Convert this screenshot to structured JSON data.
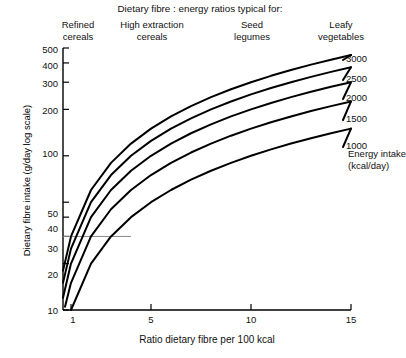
{
  "chart_data": {
    "type": "line",
    "title": "Dietary fibre : energy ratios typical for:",
    "xlabel": "Ratio dietary fibre per 100 kcal",
    "ylabel": "Dietary fibre intake (g/day log scale)",
    "yscale": "log",
    "xlim": [
      0.6,
      15
    ],
    "ylim": [
      10,
      500
    ],
    "xticks": [
      1,
      5,
      10,
      15
    ],
    "xtick_labels": [
      "1",
      "5",
      "10",
      "15"
    ],
    "yticks": [
      10,
      20,
      30,
      40,
      50,
      100,
      200,
      300,
      400,
      500
    ],
    "ytick_labels": [
      "10",
      "20",
      "30",
      "40",
      "50",
      "100",
      "200",
      "300",
      "400",
      "500"
    ],
    "grid": false,
    "legend_position": "right-inline",
    "annotations": [
      {
        "name": "reference-line-30",
        "type": "hline",
        "y": 30,
        "x_start": 0.6,
        "x_end": 4.0
      }
    ],
    "category_headers": [
      {
        "label": "Refined\ncereals",
        "x": 1.0
      },
      {
        "label": "High extraction\ncereals",
        "x": 3.8
      },
      {
        "label": "Seed\nlegumes",
        "x": 9.0
      },
      {
        "label": "Leafy\nvegetables",
        "x": 13.5
      }
    ],
    "series_caption": "Energy intake\n(kcal/day)",
    "series": [
      {
        "name": "3000",
        "label": "3000",
        "kcal_per_day": 3000,
        "x": [
          0.6,
          1,
          2,
          3,
          4,
          5,
          6,
          7,
          8,
          9,
          10,
          11,
          12,
          13,
          14,
          15
        ],
        "values": [
          18,
          30,
          60,
          90,
          120,
          150,
          180,
          210,
          240,
          270,
          300,
          330,
          360,
          390,
          420,
          450
        ]
      },
      {
        "name": "2500",
        "label": "2500",
        "kcal_per_day": 2500,
        "x": [
          0.6,
          1,
          2,
          3,
          4,
          5,
          6,
          7,
          8,
          9,
          10,
          11,
          12,
          13,
          14,
          15
        ],
        "values": [
          15,
          25,
          50,
          75,
          100,
          125,
          150,
          175,
          200,
          225,
          250,
          275,
          300,
          325,
          350,
          375
        ]
      },
      {
        "name": "2000",
        "label": "2000",
        "kcal_per_day": 2000,
        "x": [
          0.6,
          1,
          2,
          3,
          4,
          5,
          6,
          7,
          8,
          9,
          10,
          11,
          12,
          13,
          14,
          15
        ],
        "values": [
          12,
          20,
          40,
          60,
          80,
          100,
          120,
          140,
          160,
          180,
          200,
          220,
          240,
          260,
          280,
          300
        ]
      },
      {
        "name": "1500",
        "label": "1500",
        "kcal_per_day": 1500,
        "x": [
          0.7,
          1,
          2,
          3,
          4,
          5,
          6,
          7,
          8,
          9,
          10,
          11,
          12,
          13,
          14,
          15
        ],
        "values": [
          10.5,
          15,
          30,
          45,
          60,
          75,
          90,
          105,
          120,
          135,
          150,
          165,
          180,
          195,
          210,
          225
        ]
      },
      {
        "name": "1000",
        "label": "1000",
        "kcal_per_day": 1000,
        "x": [
          1,
          2,
          3,
          4,
          5,
          6,
          7,
          8,
          9,
          10,
          11,
          12,
          13,
          14,
          15
        ],
        "values": [
          10,
          20,
          30,
          40,
          50,
          60,
          70,
          80,
          90,
          100,
          110,
          120,
          130,
          140,
          150
        ]
      }
    ]
  },
  "labels": {
    "title": "Dietary fibre : energy ratios typical for:",
    "xaxis": "Ratio dietary fibre per 100 kcal",
    "yaxis": "Dietary fibre intake (g/day log scale)",
    "energy_caption_line1": "Energy intake",
    "energy_caption_line2": "(kcal/day)",
    "headers": {
      "h1_line1": "Refined",
      "h1_line2": "cereals",
      "h2_line1": "High extraction",
      "h2_line2": "cereals",
      "h3_line1": "Seed",
      "h3_line2": "legumes",
      "h4_line1": "Leafy",
      "h4_line2": "vegetables"
    },
    "xticks": {
      "t1": "1",
      "t2": "5",
      "t3": "10",
      "t4": "15"
    },
    "yticks": {
      "y500": "500",
      "y400": "400",
      "y300": "300",
      "y200": "200",
      "y100": "100",
      "y50": "50",
      "y40": "40",
      "y30": "30",
      "y20": "20",
      "y10": "10"
    },
    "curves": {
      "c3000": "3000",
      "c2500": "2500",
      "c2000": "2000",
      "c1500": "1500",
      "c1000": "1000"
    }
  },
  "colors": {
    "axis": "#000000",
    "curve": "#000000",
    "reference_line": "#888888",
    "background": "#ffffff"
  }
}
